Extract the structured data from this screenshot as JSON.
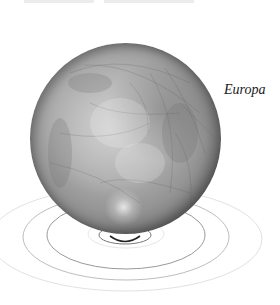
{
  "figure": {
    "label": "Europa",
    "colors": {
      "background": "#ffffff",
      "label": "#1a1a1a",
      "orbit_dark": "#888888",
      "orbit_light": "#dddddd"
    }
  }
}
